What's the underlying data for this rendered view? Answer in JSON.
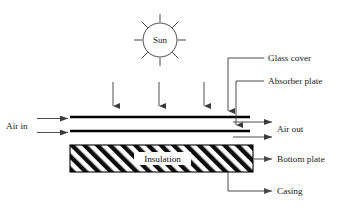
{
  "diagram": {
    "sun": {
      "label": "Sun",
      "center_x": 160,
      "center_y": 40,
      "radius": 17,
      "ray_count": 8
    },
    "insolation_arrows": {
      "name": "solar-radiation-arrows",
      "count": 3,
      "x_positions": [
        113,
        159,
        204
      ],
      "y_top": 82,
      "y_bottom": 109
    },
    "plates": {
      "glass_cover": {
        "label": "Glass cover",
        "x1": 70,
        "x2": 250,
        "y": 117
      },
      "absorber_plate": {
        "label": "Absorber plate",
        "x1": 70,
        "x2": 250,
        "y": 131
      }
    },
    "insulation": {
      "label": "Insulation",
      "x": 70,
      "y": 145,
      "width": 183,
      "height": 27,
      "hatch": "diagonal"
    },
    "flow": {
      "inlet_label": "Air in",
      "outlet_label": "Air out",
      "inlet_arrow_count": 2,
      "outlet_arrow_count": 2
    },
    "callouts": [
      {
        "id": "glass-cover",
        "label": "Glass cover",
        "text_x": 268,
        "text_y": 61
      },
      {
        "id": "absorber-plate",
        "label": "Absorber plate",
        "text_x": 268,
        "text_y": 84
      },
      {
        "id": "bottom-plate",
        "label": "Bottom plate",
        "text_x": 277,
        "text_y": 162
      },
      {
        "id": "casing",
        "label": "Casing",
        "text_x": 277,
        "text_y": 194
      }
    ],
    "colors": {
      "ink": "#1a1a1a",
      "line": "#4a4a4a",
      "plate": "#000000",
      "background": "#ffffff"
    }
  }
}
